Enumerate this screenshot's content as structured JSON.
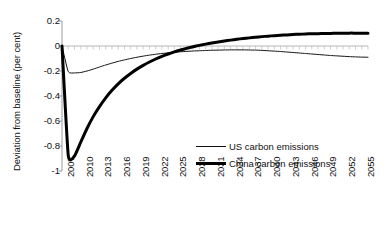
{
  "chart_data": {
    "type": "line",
    "title": "",
    "subtitle": "",
    "xlabel": "",
    "ylabel": "Deviation from baseline (per cent)",
    "xlim": [
      2007,
      2056
    ],
    "ylim": [
      -1,
      0.2
    ],
    "grid": false,
    "legend_position": "center-right-inside",
    "y_ticks": [
      "0.2",
      "0",
      "-0.2",
      "-0.4",
      "-0.6",
      "-0.8",
      "-1"
    ],
    "y_tick_values": [
      0.2,
      0,
      -0.2,
      -0.4,
      -0.6,
      -0.8,
      -1
    ],
    "x_ticks": [
      "2007",
      "2010",
      "2013",
      "2016",
      "2019",
      "2022",
      "2025",
      "2028",
      "2031",
      "2034",
      "2037",
      "2040",
      "2043",
      "2046",
      "2049",
      "2052",
      "2055"
    ],
    "x_tick_values": [
      2007,
      2010,
      2013,
      2016,
      2019,
      2022,
      2025,
      2028,
      2031,
      2034,
      2037,
      2040,
      2043,
      2046,
      2049,
      2052,
      2055
    ],
    "zero_line": 0,
    "x": [
      2007,
      2008,
      2009,
      2010,
      2011,
      2012,
      2013,
      2014,
      2015,
      2016,
      2017,
      2018,
      2019,
      2020,
      2021,
      2022,
      2023,
      2024,
      2025,
      2026,
      2027,
      2028,
      2029,
      2030,
      2031,
      2032,
      2033,
      2034,
      2035,
      2036,
      2037,
      2038,
      2039,
      2040,
      2041,
      2042,
      2043,
      2044,
      2045,
      2046,
      2047,
      2048,
      2049,
      2050,
      2051,
      2052,
      2053,
      2054,
      2055,
      2056
    ],
    "series": [
      {
        "name": "US carbon emissions",
        "color": "#111111",
        "line_width": 1,
        "style": "thin",
        "values": [
          0,
          -0.205,
          -0.215,
          -0.212,
          -0.2,
          -0.185,
          -0.168,
          -0.152,
          -0.137,
          -0.123,
          -0.111,
          -0.1,
          -0.09,
          -0.081,
          -0.073,
          -0.066,
          -0.06,
          -0.055,
          -0.05,
          -0.046,
          -0.043,
          -0.04,
          -0.038,
          -0.036,
          -0.034,
          -0.033,
          -0.032,
          -0.031,
          -0.031,
          -0.031,
          -0.032,
          -0.033,
          -0.035,
          -0.038,
          -0.041,
          -0.044,
          -0.048,
          -0.052,
          -0.056,
          -0.06,
          -0.064,
          -0.068,
          -0.072,
          -0.076,
          -0.079,
          -0.082,
          -0.085,
          -0.087,
          -0.089,
          -0.09
        ]
      },
      {
        "name": "China carbon emissions",
        "color": "#000000",
        "line_width": 3,
        "style": "thick",
        "values": [
          0,
          -0.875,
          -0.88,
          -0.77,
          -0.66,
          -0.565,
          -0.485,
          -0.415,
          -0.355,
          -0.303,
          -0.258,
          -0.22,
          -0.185,
          -0.155,
          -0.128,
          -0.104,
          -0.083,
          -0.064,
          -0.047,
          -0.032,
          -0.018,
          -0.006,
          0.005,
          0.015,
          0.024,
          0.032,
          0.04,
          0.047,
          0.054,
          0.06,
          0.065,
          0.07,
          0.075,
          0.079,
          0.083,
          0.086,
          0.089,
          0.092,
          0.094,
          0.096,
          0.098,
          0.099,
          0.1,
          0.101,
          0.102,
          0.102,
          0.103,
          0.103,
          0.103,
          0.103
        ]
      }
    ],
    "annotations": []
  },
  "legend": {
    "items": [
      {
        "label": "US carbon emissions"
      },
      {
        "label": "China carbon emissions"
      }
    ]
  }
}
